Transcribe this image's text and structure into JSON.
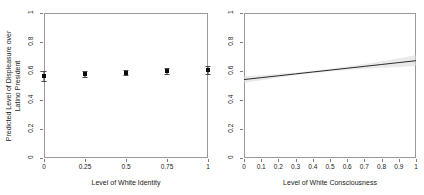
{
  "figure": {
    "background": "#ffffff",
    "frame_color": "#9a9a9a",
    "point_color": "#0d0d0d",
    "line_color": "#2b2b2b",
    "band_color": "#d9d9d9"
  },
  "chart_data": [
    {
      "type": "scatter",
      "panel": "left",
      "title": "",
      "xlabel": "Level of White Identity",
      "ylabel": "Predicted Level of Displeasure over Latino President",
      "ylabel_line1": "Predicted Level of Displeasure over",
      "ylabel_line2": "Latino President",
      "xlim": [
        0,
        1
      ],
      "ylim": [
        0,
        1
      ],
      "grid": false,
      "legend": "none",
      "xticks": [
        0,
        0.25,
        0.5,
        0.75,
        1
      ],
      "xticklabels": [
        "0",
        "0.25",
        "0.5",
        "0.75",
        "1"
      ],
      "yticks": [
        0,
        0.2,
        0.4,
        0.6,
        0.8,
        1
      ],
      "yticklabels": [
        "0",
        "0.2",
        "0.4",
        "0.6",
        "0.8",
        "1"
      ],
      "x": [
        0,
        0.25,
        0.5,
        0.75,
        1
      ],
      "values": [
        0.565,
        0.578,
        0.589,
        0.598,
        0.607
      ],
      "ci_low": [
        0.528,
        0.556,
        0.574,
        0.578,
        0.578
      ],
      "ci_high": [
        0.603,
        0.6,
        0.605,
        0.619,
        0.637
      ],
      "error_bars": true
    },
    {
      "type": "line",
      "panel": "right",
      "title": "",
      "xlabel": "Level of White Consciousness",
      "ylabel": "",
      "xlim": [
        0,
        1
      ],
      "ylim": [
        0,
        1
      ],
      "grid": false,
      "legend": "none",
      "xticks": [
        0,
        0.1,
        0.2,
        0.3,
        0.4,
        0.5,
        0.6,
        0.7,
        0.8,
        0.9,
        1
      ],
      "xticklabels": [
        "0",
        "0.1",
        "0.2",
        "0.3",
        "0.4",
        "0.5",
        "0.6",
        "0.7",
        "0.8",
        "0.9",
        "1"
      ],
      "yticks": [
        0,
        0.2,
        0.4,
        0.6,
        0.8,
        1
      ],
      "yticklabels": [
        "0",
        "0.2",
        "0.4",
        "0.6",
        "0.8",
        "1"
      ],
      "x": [
        0,
        0.1,
        0.2,
        0.3,
        0.4,
        0.5,
        0.6,
        0.7,
        0.8,
        0.9,
        1
      ],
      "values": [
        0.541,
        0.554,
        0.567,
        0.58,
        0.593,
        0.606,
        0.619,
        0.632,
        0.645,
        0.658,
        0.671
      ],
      "ci_low": [
        0.519,
        0.537,
        0.553,
        0.57,
        0.585,
        0.597,
        0.607,
        0.615,
        0.622,
        0.628,
        0.634
      ],
      "ci_high": [
        0.563,
        0.571,
        0.581,
        0.59,
        0.601,
        0.615,
        0.631,
        0.649,
        0.668,
        0.688,
        0.708
      ],
      "confidence_band": true
    }
  ]
}
